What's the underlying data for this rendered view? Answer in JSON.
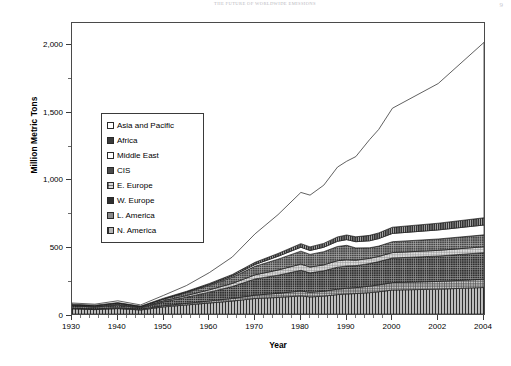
{
  "page": {
    "running_head": "THE FUTURE OF WORLDWIDE EMISSIONS",
    "folio": "9"
  },
  "figure": {
    "ylabel": "Million Metric Tons",
    "xlabel": "Year"
  },
  "legend": {
    "items": [
      {
        "label": "Asia and Pacific",
        "swatch": "asia",
        "color": "#ffffff"
      },
      {
        "label": "Africa",
        "swatch": "africa",
        "color": "#3a3a3a"
      },
      {
        "label": "Middle East",
        "swatch": "me",
        "color": "#ffffff"
      },
      {
        "label": "CIS",
        "swatch": "cis",
        "color": "#4a4a4a"
      },
      {
        "label": "E. Europe",
        "swatch": "eeurope",
        "color": "#d8d8d8"
      },
      {
        "label": "W. Europe",
        "swatch": "weurope",
        "color": "#2f2f2f"
      },
      {
        "label": "L. America",
        "swatch": "lamerica",
        "color": "#8a8a8a"
      },
      {
        "label": "N. America",
        "swatch": "namerica",
        "color": "#b7b7b7"
      }
    ]
  },
  "axes": {
    "y_ticks": [
      "0",
      "500",
      "1,000",
      "1,500",
      "2,000"
    ],
    "y_tick_values": [
      0,
      500,
      1000,
      1500,
      2000
    ],
    "y_min": 0,
    "y_max": 2250,
    "x_ticks": [
      "1930",
      "1940",
      "1950",
      "1960",
      "1970",
      "1980",
      "1990",
      "2000",
      "2002",
      "2004"
    ],
    "x_tick_values": [
      1930,
      1940,
      1950,
      1960,
      1970,
      1980,
      1990,
      2000,
      2002,
      2004
    ]
  },
  "chart_data": {
    "type": "area",
    "title": "",
    "xlabel": "Year",
    "ylabel": "Million Metric Tons",
    "ylim": [
      0,
      2250
    ],
    "xlim": [
      1930,
      2004
    ],
    "grid": false,
    "legend_position": "inside-upper-left",
    "stacked": true,
    "x": [
      1930,
      1935,
      1940,
      1945,
      1950,
      1955,
      1960,
      1965,
      1970,
      1975,
      1980,
      1982,
      1985,
      1988,
      1990,
      1992,
      1995,
      1997,
      2000,
      2002,
      2004
    ],
    "series": [
      {
        "name": "N. America",
        "values": [
          40,
          34,
          42,
          31,
          55,
          70,
          85,
          100,
          120,
          128,
          140,
          132,
          138,
          150,
          155,
          158,
          165,
          172,
          185,
          192,
          205
        ]
      },
      {
        "name": "L. America",
        "values": [
          5,
          5,
          6,
          6,
          9,
          12,
          16,
          20,
          26,
          32,
          38,
          36,
          38,
          42,
          44,
          46,
          50,
          53,
          58,
          60,
          64
        ]
      },
      {
        "name": "W. Europe",
        "values": [
          18,
          15,
          20,
          10,
          30,
          48,
          68,
          92,
          125,
          140,
          160,
          150,
          158,
          170,
          172,
          170,
          175,
          180,
          190,
          196,
          205
        ]
      },
      {
        "name": "E. Europe",
        "values": [
          4,
          4,
          6,
          4,
          8,
          13,
          18,
          24,
          32,
          40,
          48,
          45,
          46,
          50,
          48,
          42,
          40,
          40,
          42,
          44,
          46
        ]
      },
      {
        "name": "CIS",
        "values": [
          6,
          7,
          10,
          7,
          14,
          22,
          34,
          48,
          66,
          84,
          100,
          98,
          102,
          110,
          112,
          95,
          82,
          80,
          84,
          88,
          92
        ]
      },
      {
        "name": "Middle East",
        "values": [
          1,
          1,
          1,
          1,
          2,
          4,
          6,
          9,
          14,
          22,
          30,
          30,
          34,
          40,
          44,
          48,
          54,
          58,
          64,
          70,
          76
        ]
      },
      {
        "name": "Africa",
        "values": [
          2,
          2,
          3,
          2,
          4,
          6,
          9,
          12,
          17,
          22,
          28,
          28,
          30,
          34,
          36,
          38,
          42,
          44,
          48,
          52,
          56
        ]
      },
      {
        "name": "Asia and Pacific",
        "values": [
          9,
          8,
          14,
          9,
          22,
          45,
          84,
          135,
          220,
          300,
          396,
          400,
          450,
          540,
          570,
          620,
          740,
          800,
          920,
          1080,
          1356
        ]
      }
    ],
    "totals": [
      85,
      76,
      102,
      70,
      144,
      220,
      320,
      440,
      620,
      768,
      940,
      919,
      996,
      1136,
      1181,
      1217,
      1348,
      1427,
      1591,
      1782,
      2100
    ]
  }
}
